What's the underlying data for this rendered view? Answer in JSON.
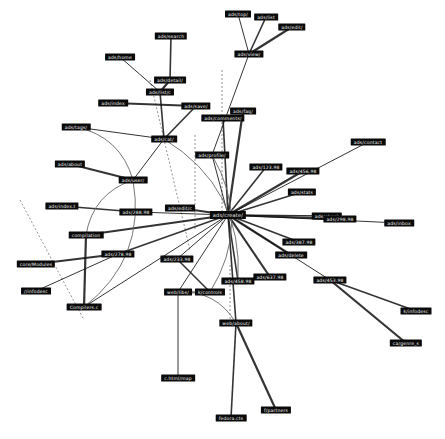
{
  "graph": {
    "nodes": [
      {
        "id": "hub",
        "label": "ads/create/",
        "x": 228,
        "y": 215,
        "big": true
      },
      {
        "id": "top1",
        "label": "ads/top/",
        "x": 238,
        "y": 14
      },
      {
        "id": "top2",
        "label": "ads/list",
        "x": 266,
        "y": 17
      },
      {
        "id": "top3",
        "label": "ads/edit/",
        "x": 292,
        "y": 27
      },
      {
        "id": "topc",
        "label": "ads/view/",
        "x": 249,
        "y": 54
      },
      {
        "id": "n1",
        "label": "ads/search",
        "x": 171,
        "y": 36
      },
      {
        "id": "n2",
        "label": "ads/home",
        "x": 120,
        "y": 57
      },
      {
        "id": "n3",
        "label": "ads/detail/",
        "x": 170,
        "y": 80
      },
      {
        "id": "n4",
        "label": "ads/list/c",
        "x": 160,
        "y": 92
      },
      {
        "id": "n5",
        "label": "ads/index",
        "x": 113,
        "y": 103
      },
      {
        "id": "n6",
        "label": "ads/save/",
        "x": 196,
        "y": 106
      },
      {
        "id": "n7",
        "label": "ads/faq/",
        "x": 243,
        "y": 111
      },
      {
        "id": "n8",
        "label": "ads/tags/",
        "x": 76,
        "y": 127
      },
      {
        "id": "n9",
        "label": "ads/cat/",
        "x": 164,
        "y": 139
      },
      {
        "id": "n10",
        "label": "ads/comments/",
        "x": 223,
        "y": 118
      },
      {
        "id": "n11",
        "label": "ads/profile/",
        "x": 212,
        "y": 155
      },
      {
        "id": "n12",
        "label": "ads/123.98",
        "x": 266,
        "y": 167
      },
      {
        "id": "n13",
        "label": "ads/456.98",
        "x": 303,
        "y": 171
      },
      {
        "id": "n14",
        "label": "ads/contact",
        "x": 368,
        "y": 142
      },
      {
        "id": "n15",
        "label": "ads/stats",
        "x": 302,
        "y": 192
      },
      {
        "id": "n16",
        "label": "ads/about",
        "x": 70,
        "y": 164
      },
      {
        "id": "n17",
        "label": "ads/user/",
        "x": 133,
        "y": 180
      },
      {
        "id": "n18",
        "label": "ads/edit/c",
        "x": 180,
        "y": 208
      },
      {
        "id": "n19",
        "label": "ads/index.t",
        "x": 62,
        "y": 206
      },
      {
        "id": "n20",
        "label": "ads/288.98",
        "x": 136,
        "y": 212
      },
      {
        "id": "n21",
        "label": "ads/check",
        "x": 327,
        "y": 216
      },
      {
        "id": "n22",
        "label": "ads/298.98",
        "x": 340,
        "y": 219
      },
      {
        "id": "n23",
        "label": "ads/inbox",
        "x": 399,
        "y": 223
      },
      {
        "id": "n24",
        "label": "ads/387.98",
        "x": 299,
        "y": 242
      },
      {
        "id": "n25",
        "label": "ads/delete",
        "x": 291,
        "y": 255
      },
      {
        "id": "n26",
        "label": "compilation",
        "x": 86,
        "y": 235
      },
      {
        "id": "n27",
        "label": "ads/278.98",
        "x": 118,
        "y": 254
      },
      {
        "id": "n28",
        "label": "core/Modules",
        "x": 36,
        "y": 264
      },
      {
        "id": "n29",
        "label": "ads/233.98",
        "x": 177,
        "y": 259
      },
      {
        "id": "n30",
        "label": "ads/453.98",
        "x": 330,
        "y": 280
      },
      {
        "id": "n31",
        "label": "ads/458.98",
        "x": 238,
        "y": 281
      },
      {
        "id": "n32",
        "label": "ads/637.98",
        "x": 270,
        "y": 277
      },
      {
        "id": "n33",
        "label": "//infodesc",
        "x": 36,
        "y": 291
      },
      {
        "id": "n34",
        "label": "Compilers.c",
        "x": 84,
        "y": 307
      },
      {
        "id": "n35",
        "label": "web/libs/",
        "x": 178,
        "y": 292
      },
      {
        "id": "n36",
        "label": "k/controls",
        "x": 210,
        "y": 292
      },
      {
        "id": "n37",
        "label": "web/about/",
        "x": 236,
        "y": 323
      },
      {
        "id": "n38",
        "label": "k/infodesc",
        "x": 416,
        "y": 311
      },
      {
        "id": "n39",
        "label": "ca/genre_s",
        "x": 406,
        "y": 343
      },
      {
        "id": "n40",
        "label": "c.html/map",
        "x": 178,
        "y": 378
      },
      {
        "id": "n41",
        "label": "f/partners",
        "x": 276,
        "y": 410
      },
      {
        "id": "n42",
        "label": "fedora.cts",
        "x": 231,
        "y": 418
      }
    ],
    "edges": [
      [
        "hub",
        "n11"
      ],
      [
        "hub",
        "n12"
      ],
      [
        "hub",
        "n13"
      ],
      [
        "hub",
        "n14"
      ],
      [
        "hub",
        "n15"
      ],
      [
        "hub",
        "n18"
      ],
      [
        "hub",
        "n20"
      ],
      [
        "hub",
        "n21"
      ],
      [
        "hub",
        "n22"
      ],
      [
        "hub",
        "n23"
      ],
      [
        "hub",
        "n24"
      ],
      [
        "hub",
        "n25"
      ],
      [
        "hub",
        "n29"
      ],
      [
        "hub",
        "n31"
      ],
      [
        "hub",
        "n32"
      ],
      [
        "hub",
        "n30"
      ],
      [
        "hub",
        "n10"
      ],
      [
        "hub",
        "n7"
      ],
      [
        "hub",
        "n35"
      ],
      [
        "hub",
        "n37"
      ],
      [
        "hub",
        "n26"
      ],
      [
        "topc",
        "top1"
      ],
      [
        "topc",
        "top2"
      ],
      [
        "topc",
        "top3"
      ],
      [
        "n11",
        "topc"
      ],
      [
        "n3",
        "n1"
      ],
      [
        "n4",
        "n3"
      ],
      [
        "n4",
        "n2"
      ],
      [
        "n9",
        "n4"
      ],
      [
        "n6",
        "n5"
      ],
      [
        "n9",
        "n8"
      ],
      [
        "n9",
        "n6"
      ],
      [
        "n17",
        "n16"
      ],
      [
        "n17",
        "n9"
      ],
      [
        "n20",
        "n19"
      ],
      [
        "n27",
        "n28"
      ],
      [
        "n27",
        "n33"
      ],
      [
        "n27",
        "hub"
      ],
      [
        "n34",
        "n26"
      ],
      [
        "n34",
        "hub"
      ],
      [
        "n30",
        "n38"
      ],
      [
        "n30",
        "n39"
      ],
      [
        "n35",
        "n40"
      ],
      [
        "n37",
        "n42"
      ],
      [
        "n37",
        "n41"
      ],
      [
        "n35",
        "n36"
      ],
      [
        "n36",
        "n29"
      ]
    ],
    "curves": [
      [
        "n8",
        "n17"
      ],
      [
        "n17",
        "n34"
      ],
      [
        "n26",
        "n17"
      ],
      [
        "n9",
        "n31"
      ],
      [
        "n35",
        "n37"
      ],
      [
        "n11",
        "n36"
      ]
    ],
    "dashed": [
      [
        20,
        200,
        84,
        320
      ],
      [
        150,
        80,
        190,
        250
      ],
      [
        222,
        70,
        222,
        225
      ],
      [
        195,
        135,
        195,
        230
      ],
      [
        230,
        265,
        230,
        325
      ]
    ]
  }
}
